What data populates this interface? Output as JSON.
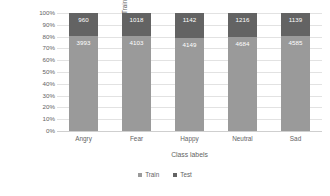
{
  "chart_data": {
    "type": "bar",
    "subtype": "stacked-percentage",
    "title": "",
    "xlabel": "Class labels",
    "ylabel": "Train and test distribution percentage",
    "categories": [
      "Angry",
      "Fear",
      "Happy",
      "Neutral",
      "Sad"
    ],
    "series": [
      {
        "name": "Train",
        "color": "#9a9a9a",
        "values": [
          3993,
          4103,
          4149,
          4684,
          4585
        ]
      },
      {
        "name": "Test",
        "color": "#636363",
        "values": [
          960,
          1018,
          1142,
          1216,
          1139
        ]
      }
    ],
    "ytick_labels": [
      "100%",
      "90%",
      "80%",
      "70%",
      "60%",
      "50%",
      "40%",
      "30%",
      "20%",
      "10%",
      "0%"
    ],
    "ytick_values": [
      100,
      90,
      80,
      70,
      60,
      50,
      40,
      30,
      20,
      10,
      0
    ],
    "ylim": [
      0,
      100
    ],
    "grid": true,
    "legend_position": "bottom",
    "legend": [
      "Train",
      "Test"
    ]
  },
  "axes": {
    "y_title": "Train and test distribution percentage",
    "x_title": "Class labels"
  },
  "colors": {
    "train": "#9a9a9a",
    "test": "#636363",
    "gridline": "#e2e2e2",
    "text": "#636363",
    "label_text": "#ffffff",
    "background": "#ffffff"
  }
}
